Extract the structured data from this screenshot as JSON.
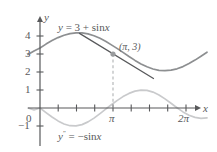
{
  "figure": {
    "type": "math-graph",
    "axes": {
      "x_axis_label": "x",
      "y_axis_label": "y",
      "x_ticks": [
        {
          "value": 0,
          "label": ""
        },
        {
          "value": 0.7853981634,
          "label": ""
        },
        {
          "value": 1.5707963268,
          "label": ""
        },
        {
          "value": 2.3561944902,
          "label": ""
        },
        {
          "value": 3.1415926536,
          "label": "π"
        },
        {
          "value": 3.926990817,
          "label": ""
        },
        {
          "value": 4.7123889804,
          "label": ""
        },
        {
          "value": 5.4977871438,
          "label": ""
        },
        {
          "value": 6.2831853072,
          "label": "2π"
        }
      ],
      "y_ticks": [
        {
          "value": 4,
          "label": "4"
        },
        {
          "value": 3,
          "label": "3"
        },
        {
          "value": 2,
          "label": "2"
        },
        {
          "value": 1,
          "label": "1"
        },
        {
          "value": 0,
          "label": "0"
        },
        {
          "value": -1,
          "label": "−1"
        }
      ],
      "xlim": [
        -0.25,
        6.95
      ],
      "ylim": [
        -1.6,
        4.8
      ]
    },
    "curves": [
      {
        "name": "primary-function",
        "expression": "y = 3 + sin x",
        "label_y": "y",
        "label_eq": " = 3 + ",
        "label_fn": "sin",
        "label_var": "x",
        "color": "#8d8f91",
        "width": 1.6
      },
      {
        "name": "second-derivative",
        "expression": "y″ = −sin x",
        "label_y": "y",
        "label_prime": "″",
        "label_eq": " = −",
        "label_fn": "sin",
        "label_var": "x",
        "color": "#c9cacc",
        "width": 1.6
      }
    ],
    "tangent_line": {
      "name": "tangent-at-pi",
      "slope": -1,
      "through_x": 3.1415926536,
      "through_y": 3,
      "x_start": 2.0,
      "x_end": 4.45,
      "color": "#58595b",
      "width": 1.3
    },
    "marked_point": {
      "label": "(π, 3)",
      "x": 3.1415926536,
      "y": 3,
      "color": "#9a9c9e"
    },
    "dashed_drop": {
      "name": "pi-dropline",
      "x": 3.1415926536,
      "from_y": 3,
      "to_y": 0,
      "color": "#b0b2b4"
    },
    "colors": {
      "axis": "#58595b",
      "text": "#58595b",
      "curve_primary": "#8d8f91",
      "curve_secondary": "#c9cacc",
      "tangent": "#58595b",
      "background": "#ffffff"
    }
  }
}
